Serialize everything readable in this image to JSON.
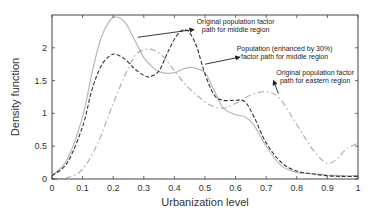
{
  "chart_data": {
    "type": "line",
    "title": "",
    "xlabel": "Urbanization level",
    "ylabel": "Density function",
    "xlim": [
      0,
      1
    ],
    "ylim": [
      0,
      2.5
    ],
    "xticks": [
      0,
      0.1,
      0.2,
      0.3,
      0.4,
      0.5,
      0.6,
      0.7,
      0.8,
      0.9,
      1
    ],
    "xtick_labels": [
      "0",
      "0.1",
      "0.2",
      "0.3",
      "0.4",
      "0.5",
      "0.6",
      "0.7",
      "0.8",
      "0.9",
      "1"
    ],
    "yticks": [
      0,
      0.5,
      1,
      1.5,
      2
    ],
    "ytick_labels": [
      "0",
      "0.5",
      "1",
      "1.5",
      "2"
    ],
    "grid": false,
    "legend": "none (annotations with arrows)",
    "series": [
      {
        "name": "Original population factor path for middle region",
        "style": "solid",
        "color": "#b8b8b8",
        "x": [
          0,
          0.05,
          0.1,
          0.13,
          0.16,
          0.19,
          0.21,
          0.24,
          0.27,
          0.3,
          0.33,
          0.36,
          0.4,
          0.43,
          0.46,
          0.5,
          0.53,
          0.56,
          0.6,
          0.63,
          0.66,
          0.7,
          0.75,
          0.8,
          0.85,
          0.9,
          0.95,
          1
        ],
        "y": [
          0.05,
          0.3,
          0.95,
          1.6,
          2.15,
          2.42,
          2.47,
          2.38,
          2.12,
          1.85,
          1.7,
          1.62,
          1.62,
          1.68,
          1.7,
          1.62,
          1.35,
          1.08,
          0.98,
          0.95,
          0.82,
          0.5,
          0.2,
          0.1,
          0.08,
          0.06,
          0.05,
          0.05
        ]
      },
      {
        "name": "Population (enhanced by 30%) factor path for middle region",
        "style": "dashed",
        "color": "#333333",
        "x": [
          0,
          0.05,
          0.1,
          0.13,
          0.16,
          0.19,
          0.21,
          0.24,
          0.27,
          0.3,
          0.32,
          0.35,
          0.38,
          0.41,
          0.44,
          0.47,
          0.5,
          0.53,
          0.56,
          0.6,
          0.63,
          0.66,
          0.7,
          0.75,
          0.8,
          0.85,
          0.9,
          0.95,
          1
        ],
        "y": [
          0.05,
          0.25,
          0.8,
          1.35,
          1.72,
          1.88,
          1.9,
          1.82,
          1.68,
          1.58,
          1.56,
          1.65,
          1.95,
          2.2,
          2.27,
          2.05,
          1.6,
          1.28,
          1.2,
          1.2,
          1.18,
          0.95,
          0.55,
          0.25,
          0.12,
          0.08,
          0.05,
          0.04,
          0.04
        ]
      },
      {
        "name": "Original population factor path for eastern region",
        "style": "dash-dot",
        "color": "#a8a8a8",
        "x": [
          0,
          0.05,
          0.1,
          0.15,
          0.2,
          0.25,
          0.28,
          0.32,
          0.36,
          0.4,
          0.44,
          0.48,
          0.52,
          0.56,
          0.6,
          0.65,
          0.7,
          0.74,
          0.78,
          0.82,
          0.86,
          0.9,
          0.93,
          0.96,
          1
        ],
        "y": [
          0,
          0.02,
          0.15,
          0.55,
          1.15,
          1.7,
          1.92,
          1.98,
          1.88,
          1.65,
          1.42,
          1.25,
          1.12,
          1.08,
          1.15,
          1.28,
          1.33,
          1.25,
          0.98,
          0.68,
          0.4,
          0.24,
          0.3,
          0.45,
          0.55
        ]
      }
    ],
    "annotations": [
      {
        "lines": [
          "Original population factor",
          "path for middle region"
        ],
        "text_x": 0.6,
        "text_y": 2.37,
        "arrow_to": [
          0.28,
          2.16
        ]
      },
      {
        "lines": [
          "Population (enhanced by 30%)",
          "factor path for middle region"
        ],
        "text_x": 0.76,
        "text_y": 1.95,
        "arrow_to": [
          0.5,
          1.75
        ]
      },
      {
        "lines": [
          "Original population factor",
          "path for eastern region"
        ],
        "text_x": 0.86,
        "text_y": 1.59,
        "arrow_to": [
          0.74,
          1.3
        ]
      }
    ]
  }
}
